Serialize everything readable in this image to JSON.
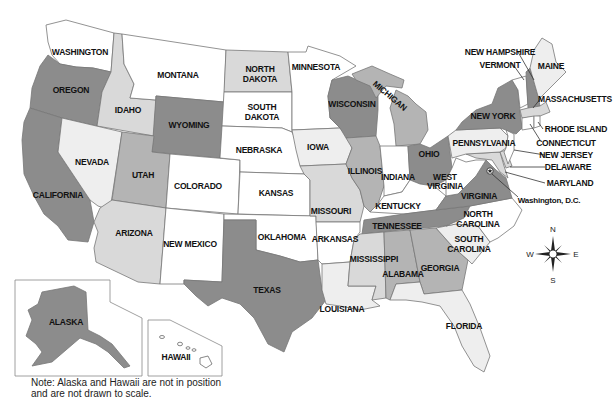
{
  "map": {
    "title": "United States",
    "shades": {
      "dark": "#8c8c8c",
      "medium": "#b4b4b4",
      "light": "#d9d9d9",
      "pale": "#eeeeee",
      "white": "#ffffff"
    },
    "states": {
      "washington": "WASHINGTON",
      "oregon": "OREGON",
      "california": "CALIFORNIA",
      "idaho": "IDAHO",
      "nevada": "NEVADA",
      "montana": "MONTANA",
      "wyoming": "WYOMING",
      "utah": "UTAH",
      "arizona": "ARIZONA",
      "colorado": "COLORADO",
      "new_mexico": "NEW MEXICO",
      "north_dakota_1": "NORTH",
      "north_dakota_2": "DAKOTA",
      "south_dakota_1": "SOUTH",
      "south_dakota_2": "DAKOTA",
      "nebraska": "NEBRASKA",
      "kansas": "KANSAS",
      "oklahoma": "OKLAHOMA",
      "texas": "TEXAS",
      "minnesota": "MINNESOTA",
      "iowa": "IOWA",
      "missouri": "MISSOURI",
      "arkansas": "ARKANSAS",
      "louisiana": "LOUISIANA",
      "wisconsin": "WISCONSIN",
      "michigan": "MICHIGAN",
      "illinois": "ILLINOIS",
      "indiana": "INDIANA",
      "ohio": "OHIO",
      "kentucky": "KENTUCKY",
      "tennessee": "TENNESSEE",
      "mississippi": "MISSISSIPPI",
      "alabama": "ALABAMA",
      "georgia": "GEORGIA",
      "florida": "FLORIDA",
      "south_carolina_1": "SOUTH",
      "south_carolina_2": "CAROLINA",
      "north_carolina_1": "NORTH",
      "north_carolina_2": "CAROLINA",
      "virginia": "VIRGINIA",
      "west_virginia_1": "WEST",
      "west_virginia_2": "VIRGINIA",
      "pennsylvania": "PENNSYLVANIA",
      "new_york": "NEW YORK",
      "vermont": "VERMONT",
      "new_hampshire": "NEW HAMPSHIRE",
      "maine": "MAINE",
      "massachusetts": "MASSACHUSETTS",
      "rhode_island": "RHODE ISLAND",
      "connecticut": "CONNECTICUT",
      "new_jersey": "NEW JERSEY",
      "delaware": "DELAWARE",
      "maryland": "MARYLAND",
      "dc": "Washington, D.C.",
      "alaska": "ALASKA",
      "hawaii": "HAWAII"
    },
    "compass": {
      "n": "N",
      "s": "S",
      "e": "E",
      "w": "W"
    },
    "note_line1": "Note: Alaska and Hawaii are not in position",
    "note_line2": "and are not drawn to scale."
  }
}
